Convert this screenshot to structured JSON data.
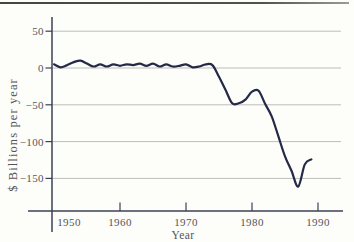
{
  "page": {
    "background": "#fdfdf9",
    "top_rule_color": "#4a4a4a"
  },
  "chart_data": {
    "type": "line",
    "title": "",
    "xlabel": "Year",
    "ylabel": "$ Billions per year",
    "grid": true,
    "legend_position": "none",
    "xlim": [
      1949.7,
      1993.8
    ],
    "ylim": [
      -194,
      69
    ],
    "x_ticks": [
      {
        "value": 1950,
        "label": "1950"
      },
      {
        "value": 1960,
        "label": "1960"
      },
      {
        "value": 1970,
        "label": "1970"
      },
      {
        "value": 1980,
        "label": "1980"
      },
      {
        "value": 1990,
        "label": "1990"
      }
    ],
    "y_ticks": [
      {
        "value": 50,
        "label": "50"
      },
      {
        "value": 0,
        "label": "0"
      },
      {
        "value": -50,
        "label": "−50"
      },
      {
        "value": -100,
        "label": "−100"
      },
      {
        "value": -150,
        "label": "−150"
      }
    ],
    "series": [
      {
        "name": "trade-balance",
        "color": "#232946",
        "x": [
          1950,
          1951,
          1952,
          1953,
          1954,
          1955,
          1956,
          1957,
          1958,
          1959,
          1960,
          1961,
          1962,
          1963,
          1964,
          1965,
          1966,
          1967,
          1968,
          1969,
          1970,
          1971,
          1972,
          1973,
          1974,
          1975,
          1976,
          1977,
          1978,
          1979,
          1980,
          1981,
          1982,
          1983,
          1984,
          1985,
          1986,
          1987,
          1988,
          1989
        ],
        "y": [
          5,
          1,
          4,
          8,
          10,
          6,
          2,
          5,
          2,
          5,
          3,
          5,
          4,
          6,
          3,
          6,
          2,
          5,
          2,
          3,
          5,
          1,
          2,
          5,
          4,
          -12,
          -30,
          -48,
          -48,
          -43,
          -32,
          -31,
          -49,
          -66,
          -93,
          -120,
          -140,
          -161,
          -131,
          -124
        ]
      }
    ],
    "axis_color": "#3c4154",
    "grid_color": "#bdbdba",
    "label_color": "#54555c"
  }
}
